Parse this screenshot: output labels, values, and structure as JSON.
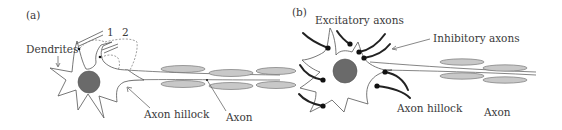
{
  "figure": {
    "panel_a": {
      "label": "(a)",
      "labels": {
        "dendrites": "Dendrites",
        "electrode_1": "1",
        "electrode_2": "2",
        "axon_hillock": "Axon hillock",
        "axon": "Axon"
      }
    },
    "panel_b": {
      "label": "(b)",
      "labels": {
        "excitatory_axons": "Excitatory axons",
        "inhibitory_axons": "Inhibitory axons",
        "axon_hillock": "Axon hillock",
        "axon": "Axon"
      }
    },
    "colors": {
      "nucleus": "#6a6a6a",
      "myelin": "#c8c8c8",
      "synapse": "#111111",
      "text": "#3a3a3a"
    }
  }
}
